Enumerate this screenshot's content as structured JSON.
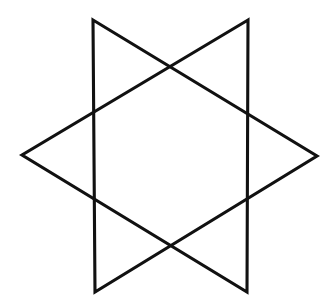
{
  "figure": {
    "shape_name": "hexagram",
    "caption": "",
    "canvas": {
      "width": 336,
      "height": 308,
      "background_color": "#ffffff"
    },
    "style": {
      "stroke_color": "#111111",
      "stroke_width": 3.1,
      "fill": "none"
    },
    "geometry": {
      "description": "Two overlapping equilateral triangles forming a hollow six-pointed star with an open hexagonal center",
      "outer_points": [
        {
          "name": "top-left-point",
          "x": 93,
          "y": 20
        },
        {
          "name": "top-right-point",
          "x": 248,
          "y": 20
        },
        {
          "name": "right-point",
          "x": 317,
          "y": 156
        },
        {
          "name": "bottom-right-point",
          "x": 247,
          "y": 292
        },
        {
          "name": "bottom-left-point",
          "x": 95,
          "y": 292
        },
        {
          "name": "left-point",
          "x": 22,
          "y": 155
        }
      ],
      "inner_hexagon_vertices": [
        {
          "name": "inner-top",
          "x": 170,
          "y": 65
        },
        {
          "name": "inner-upper-right",
          "x": 247,
          "y": 107
        },
        {
          "name": "inner-lower-right",
          "x": 247,
          "y": 203
        },
        {
          "name": "inner-bottom",
          "x": 170,
          "y": 246
        },
        {
          "name": "inner-lower-left",
          "x": 95,
          "y": 203
        },
        {
          "name": "inner-upper-left",
          "x": 95,
          "y": 106
        }
      ],
      "triangle_a": {
        "name": "pointing-right-triangle",
        "points": "93,20 317,156 95,292"
      },
      "triangle_b": {
        "name": "pointing-left-triangle",
        "points": "248,20 22,155 247,292"
      }
    }
  }
}
